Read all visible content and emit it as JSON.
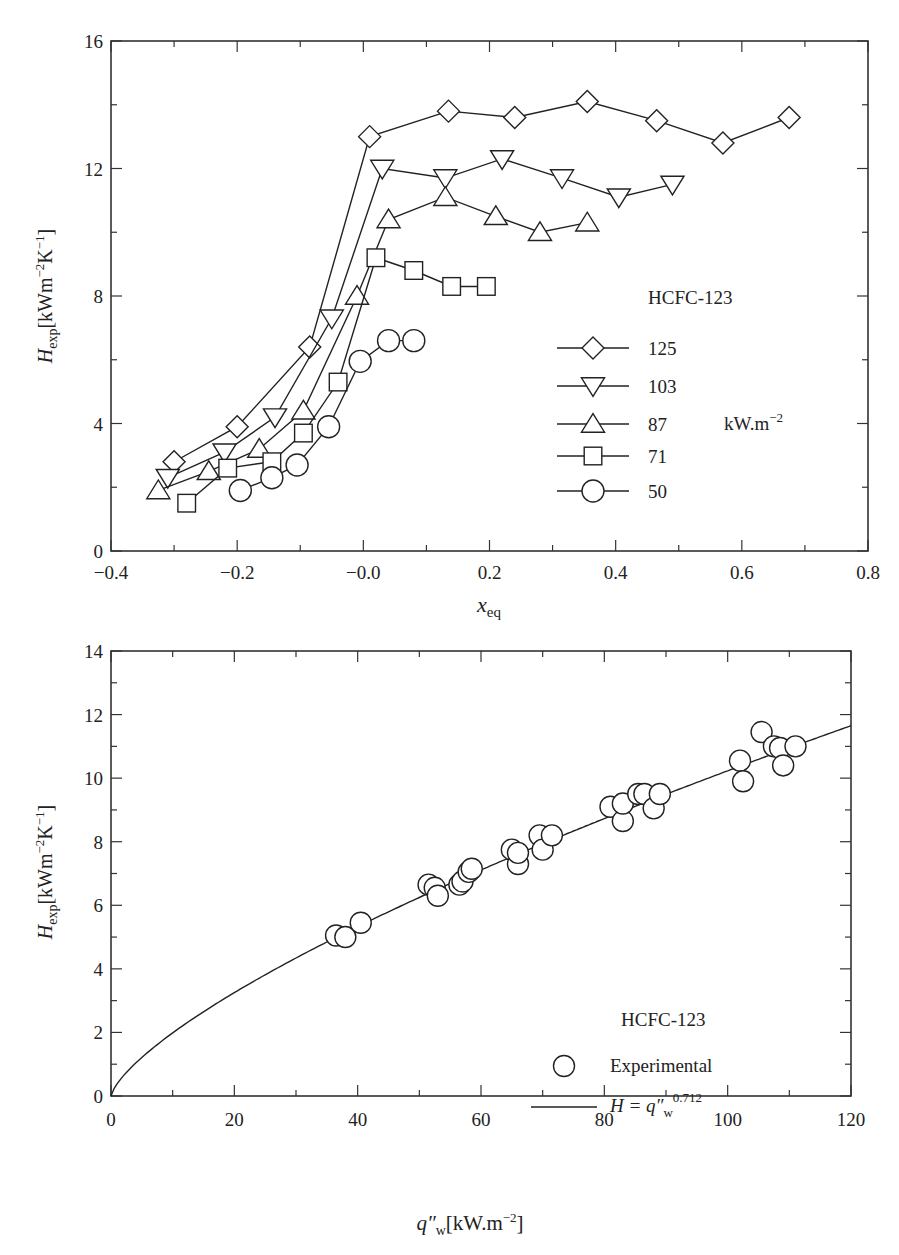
{
  "chart_data": [
    {
      "type": "line",
      "title": "",
      "xlabel": "x_eq",
      "ylabel": "H_exp [kWm^-2K^-1]",
      "xlim": [
        -0.4,
        0.8
      ],
      "ylim": [
        0,
        16
      ],
      "x_ticks": [
        "-0.4",
        "-0.2",
        "-0.0",
        "0.2",
        "0.4",
        "0.6",
        "0.8"
      ],
      "y_ticks": [
        "0",
        "4",
        "8",
        "12",
        "16"
      ],
      "grid": false,
      "legend_title": "HCFC-123",
      "legend_unit": "kW.m^-2",
      "legend_position": "right-center",
      "series": [
        {
          "name": "125",
          "marker": "diamond",
          "x": [
            -0.3,
            -0.2,
            -0.085,
            0.01,
            0.135,
            0.24,
            0.355,
            0.465,
            0.57,
            0.675
          ],
          "y": [
            2.8,
            3.9,
            6.4,
            13.0,
            13.8,
            13.6,
            14.1,
            13.5,
            12.8,
            13.6
          ]
        },
        {
          "name": "103",
          "marker": "triangle-down",
          "x": [
            -0.31,
            -0.22,
            -0.14,
            -0.05,
            0.03,
            0.13,
            0.22,
            0.315,
            0.405,
            0.49
          ],
          "y": [
            2.3,
            3.1,
            4.2,
            7.3,
            12.0,
            11.7,
            12.3,
            11.7,
            11.1,
            11.5
          ]
        },
        {
          "name": "87",
          "marker": "triangle-up",
          "x": [
            -0.325,
            -0.245,
            -0.165,
            -0.095,
            -0.01,
            0.04,
            0.13,
            0.21,
            0.28,
            0.355
          ],
          "y": [
            1.9,
            2.5,
            3.2,
            4.4,
            8.0,
            10.4,
            11.1,
            10.5,
            10.0,
            10.3
          ]
        },
        {
          "name": "71",
          "marker": "square",
          "x": [
            -0.28,
            -0.215,
            -0.145,
            -0.095,
            -0.04,
            0.02,
            0.08,
            0.14,
            0.195
          ],
          "y": [
            1.5,
            2.6,
            2.8,
            3.7,
            5.3,
            9.2,
            8.8,
            8.3,
            8.3
          ]
        },
        {
          "name": "50",
          "marker": "circle",
          "x": [
            -0.195,
            -0.145,
            -0.105,
            -0.055,
            -0.005,
            0.04,
            0.08
          ],
          "y": [
            1.9,
            2.3,
            2.7,
            3.9,
            5.95,
            6.6,
            6.6
          ]
        }
      ]
    },
    {
      "type": "scatter",
      "title": "",
      "xlabel": "q''_w [kW.m^-2]",
      "ylabel": "H_exp [kWm^-2K^-1]",
      "xlim": [
        0,
        120
      ],
      "ylim": [
        0,
        14
      ],
      "x_ticks": [
        "0",
        "20",
        "40",
        "60",
        "80",
        "100",
        "120"
      ],
      "y_ticks": [
        "0",
        "2",
        "4",
        "6",
        "8",
        "10",
        "12",
        "14"
      ],
      "grid": false,
      "legend_title": "HCFC-123",
      "legend_position": "lower-right",
      "series": [
        {
          "name": "Experimental",
          "marker": "circle",
          "x": [
            36.5,
            38,
            40.5,
            51.5,
            52.5,
            53,
            56.5,
            57,
            58,
            58.5,
            65,
            66,
            66,
            69.5,
            70,
            71.5,
            81,
            83,
            83,
            85.5,
            86.5,
            88,
            89,
            102,
            102.5,
            105.5,
            107.5,
            108.5,
            109,
            111
          ],
          "y": [
            5.05,
            5.0,
            5.45,
            6.65,
            6.55,
            6.3,
            6.65,
            6.75,
            7.05,
            7.15,
            7.75,
            7.3,
            7.65,
            8.2,
            7.75,
            8.2,
            9.1,
            8.65,
            9.2,
            9.5,
            9.5,
            9.05,
            9.5,
            10.55,
            9.9,
            11.45,
            11.0,
            10.95,
            10.4,
            11.0
          ]
        },
        {
          "name": "H = q''_w^0.712",
          "marker": "none",
          "line": "solid",
          "function": "H = q_w^0.712",
          "x": [
            0,
            10,
            20,
            30,
            40,
            50,
            60,
            70,
            80,
            90,
            100,
            110,
            120
          ],
          "y": [
            0,
            2.2,
            3.4,
            4.4,
            5.3,
            6.1,
            6.8,
            7.5,
            8.2,
            8.9,
            9.5,
            10.1,
            11.65
          ]
        }
      ]
    }
  ],
  "top_chart": {
    "ylabel_main": "H",
    "ylabel_sub": "exp",
    "ylabel_unit_prefix": "[kWm",
    "ylabel_exp1": "−2",
    "ylabel_K": "K",
    "ylabel_exp2": "−1",
    "ylabel_close": "]",
    "xlabel_main": "x",
    "xlabel_sub": "eq",
    "legend_title": "HCFC-123",
    "legend_labels": [
      "125",
      "103",
      "87",
      "71",
      "50"
    ],
    "legend_unit": "kW.m",
    "legend_unit_exp": "−2",
    "x_tick_labels": [
      "−0.4",
      "−0.2",
      "−0.0",
      "0.2",
      "0.4",
      "0.6",
      "0.8"
    ],
    "y_tick_labels": [
      "0",
      "4",
      "8",
      "12",
      "16"
    ]
  },
  "bottom_chart": {
    "ylabel_main": "H",
    "ylabel_sub": "exp",
    "ylabel_unit_prefix": "[kWm",
    "ylabel_exp1": "−2",
    "ylabel_K": "K",
    "ylabel_exp2": "−1",
    "ylabel_close": "]",
    "xlabel_main": "q″",
    "xlabel_sub": "w",
    "xlabel_unit": "[kW.m",
    "xlabel_exp": "−2",
    "xlabel_close": "]",
    "legend_title": "HCFC-123",
    "legend_marker_label": "Experimental",
    "legend_line_prefix": "H = q″",
    "legend_line_sub": "w",
    "legend_line_exp": "0.712",
    "x_tick_labels": [
      "0",
      "20",
      "40",
      "60",
      "80",
      "100",
      "120"
    ],
    "y_tick_labels": [
      "0",
      "2",
      "4",
      "6",
      "8",
      "10",
      "12",
      "14"
    ]
  }
}
